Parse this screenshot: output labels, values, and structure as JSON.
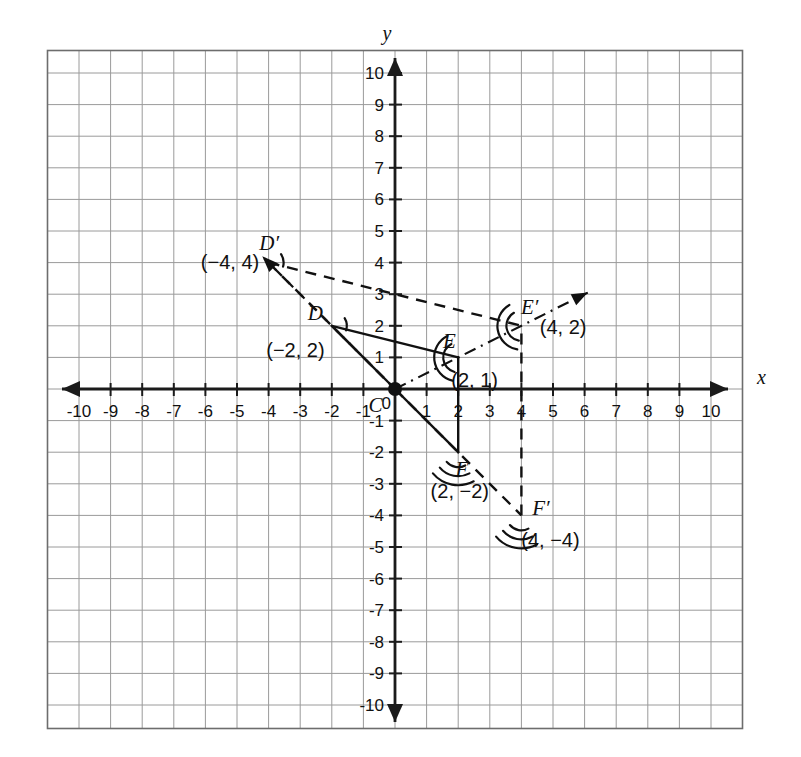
{
  "figure": {
    "type": "coordinate-plane-geometry"
  },
  "axes": {
    "x_name": "x",
    "y_name": "y",
    "x_ticks": [
      "-10",
      "-9",
      "-8",
      "-7",
      "-6",
      "-5",
      "-4",
      "-3",
      "-2",
      "-1",
      "1",
      "2",
      "3",
      "4",
      "5",
      "6",
      "7",
      "8",
      "9",
      "10"
    ],
    "y_ticks": [
      "10",
      "9",
      "8",
      "7",
      "6",
      "5",
      "4",
      "3",
      "2",
      "1",
      "-1",
      "-2",
      "-3",
      "-4",
      "-5",
      "-6",
      "-7",
      "-8",
      "-9",
      "-10"
    ],
    "origin_label": "0",
    "xlim": [
      -11,
      11
    ],
    "ylim": [
      -11,
      11
    ],
    "grid": true
  },
  "chart_data": {
    "type": "scatter",
    "xlabel": "x",
    "ylabel": "y",
    "xlim": [
      -11,
      11
    ],
    "ylim": [
      -11,
      11
    ],
    "grid": true,
    "points": [
      {
        "name": "C",
        "x": 0,
        "y": 0,
        "label": "C",
        "coord_text": "",
        "marked_dot": true,
        "arcs": 0
      },
      {
        "name": "D",
        "x": -2,
        "y": 2,
        "label": "D",
        "coord_text": "(−2, 2)",
        "marked_dot": false,
        "arcs": 1
      },
      {
        "name": "E",
        "x": 2,
        "y": 1,
        "label": "E",
        "coord_text": "(2, 1)",
        "marked_dot": false,
        "arcs": 2
      },
      {
        "name": "F",
        "x": 2,
        "y": -2,
        "label": "F",
        "coord_text": "(2, −2)",
        "marked_dot": false,
        "arcs": 3
      },
      {
        "name": "D'",
        "x": -4,
        "y": 4,
        "label": "D′",
        "coord_text": "(−4, 4)",
        "marked_dot": false,
        "arcs": 1
      },
      {
        "name": "E'",
        "x": 4,
        "y": 2,
        "label": "E′",
        "coord_text": "(4, 2)",
        "marked_dot": false,
        "arcs": 2
      },
      {
        "name": "F'",
        "x": 4,
        "y": -4,
        "label": "F′",
        "coord_text": "(4, −4)",
        "marked_dot": false,
        "arcs": 3
      }
    ],
    "segments": [
      {
        "from": "D",
        "to": "E",
        "style": "solid",
        "desc": "side-DE"
      },
      {
        "from": "D",
        "to": "C",
        "style": "solid",
        "desc": "side-DC"
      },
      {
        "from": "C",
        "to": "F",
        "style": "solid",
        "desc": "side-CF"
      },
      {
        "from": "F",
        "to": "E",
        "style": "solid",
        "desc": "side-FE"
      },
      {
        "from": "D'",
        "to": "E'",
        "style": "dashed",
        "desc": "image-side-D'E'"
      },
      {
        "from": "D'",
        "to": "C",
        "style": "dashed",
        "desc": "image-side-D'C"
      },
      {
        "from": "C",
        "to": "F'",
        "style": "dashed",
        "desc": "image-side-CF'"
      },
      {
        "from": "F'",
        "to": "E'",
        "style": "dashed",
        "desc": "image-side-F'E'"
      }
    ],
    "rays": [
      {
        "from": "C",
        "through": "D'",
        "tip_x": -4.2,
        "tip_y": 4.2,
        "style": "dashed",
        "desc": "ray-C-to-D-prime"
      },
      {
        "from": "C",
        "through": "E'",
        "tip_x": 6.1,
        "tip_y": 3.05,
        "style": "dashdot",
        "desc": "ray-C-to-E-prime"
      }
    ],
    "annotations": [
      {
        "text": "C is the center of rotation at the origin"
      },
      {
        "text": "D(−2, 2) maps to D′(−4, 4)"
      },
      {
        "text": "E(2, 1) maps to E′(4, 2)"
      },
      {
        "text": "F(2, −2) maps to F′(4, −4)"
      }
    ]
  },
  "colors": {
    "grid": "#9a9a9a",
    "axis": "#1b1b1b",
    "ink": "#111111",
    "background": "#ffffff"
  }
}
